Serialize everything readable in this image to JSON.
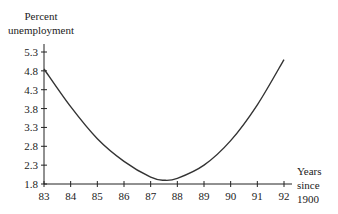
{
  "chart_data": {
    "type": "line",
    "title": "",
    "ylabel": [
      "Percent",
      "unemployment"
    ],
    "xlabel": [
      "Years",
      "since",
      "1900"
    ],
    "x_ticks": [
      "83",
      "84",
      "85",
      "86",
      "87",
      "88",
      "89",
      "90",
      "91",
      "92"
    ],
    "y_ticks": [
      "1.8",
      "2.3",
      "2.8",
      "3.3",
      "3.8",
      "4.3",
      "4.8",
      "5.3"
    ],
    "xlim": [
      83,
      92.3
    ],
    "ylim": [
      1.8,
      5.4
    ],
    "grid": false,
    "legend": null,
    "series": [
      {
        "name": "Percent unemployment",
        "x": [
          83,
          84,
          85,
          86,
          87,
          87.5,
          88,
          89,
          90,
          91,
          92
        ],
        "values": [
          4.85,
          3.85,
          3.0,
          2.4,
          1.98,
          1.9,
          1.95,
          2.3,
          2.95,
          3.9,
          5.1
        ]
      }
    ]
  },
  "colors": {
    "axis": "#222222",
    "curve": "#333333"
  }
}
